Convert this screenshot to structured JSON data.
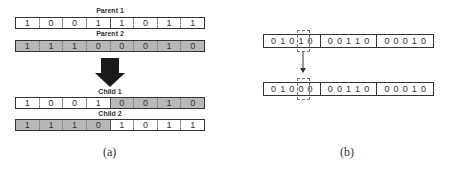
{
  "panel_a": {
    "parent1": {
      "label": "Parent 1",
      "bits": [
        "1",
        "0",
        "0",
        "1",
        "1",
        "0",
        "1",
        "1"
      ],
      "shade": [
        "w",
        "w",
        "w",
        "w",
        "w",
        "w",
        "w",
        "w"
      ]
    },
    "parent2": {
      "label": "Parent 2",
      "bits": [
        "1",
        "1",
        "1",
        "0",
        "0",
        "0",
        "1",
        "0"
      ],
      "shade": [
        "g",
        "g",
        "g",
        "g",
        "g",
        "g",
        "g",
        "g"
      ]
    },
    "child1": {
      "label": "Child 1",
      "bits": [
        "1",
        "0",
        "0",
        "1",
        "0",
        "0",
        "1",
        "0"
      ],
      "shade": [
        "w",
        "w",
        "w",
        "w",
        "g",
        "g",
        "g",
        "g"
      ]
    },
    "child2": {
      "label": "Child 2",
      "bits": [
        "1",
        "1",
        "1",
        "0",
        "1",
        "0",
        "1",
        "1"
      ],
      "shade": [
        "g",
        "g",
        "g",
        "g",
        "w",
        "w",
        "w",
        "w"
      ]
    },
    "arrow_icon": "down-arrow-icon",
    "caption": "(a)"
  },
  "panel_b": {
    "before": [
      [
        "0",
        "1",
        "0",
        "1",
        "0"
      ],
      [
        "0",
        "0",
        "1",
        "1",
        "0"
      ],
      [
        "0",
        "0",
        "0",
        "1",
        "0"
      ]
    ],
    "after": [
      [
        "0",
        "1",
        "0",
        "0",
        "0"
      ],
      [
        "0",
        "0",
        "1",
        "1",
        "0"
      ],
      [
        "0",
        "0",
        "0",
        "1",
        "0"
      ]
    ],
    "mutated_index": 3,
    "caption": "(b)"
  },
  "colors": {
    "shaded": "#b8b8b8",
    "border": "#333333"
  }
}
